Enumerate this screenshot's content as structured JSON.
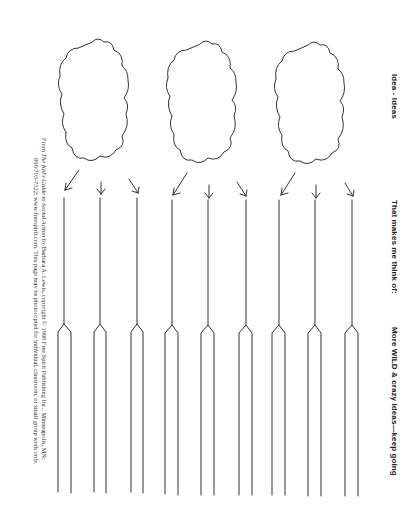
{
  "headers": {
    "col1": "Idea - Ideas",
    "col2": "That makes me think of:",
    "col3": "More WILD & crazy ideas—keep going"
  },
  "credit": {
    "line1_prefix": "From ",
    "line1_title": "The Kid's Guide to Social Action",
    "line1_rest": " by Barbara A. Lewis, copyright © 1998 Free Spirit Publishing Inc., Minneapolis, MN;",
    "line2": "866/703-7322; www.freespirit.com. This page may be photocopied for individual, classroom, or small group work only."
  },
  "worksheet": {
    "cloud_count": 3,
    "branches_per_cloud": 3,
    "stroke_color": "#333333"
  }
}
